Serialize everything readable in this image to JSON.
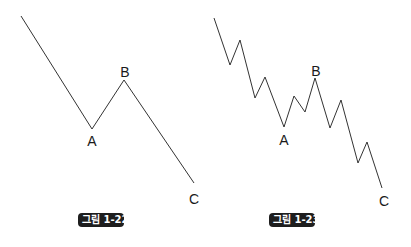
{
  "figures": [
    {
      "caption": "그림 1-22",
      "labels": {
        "A": "A",
        "B": "B",
        "C": "C"
      },
      "points": [
        [
          21,
          16
        ],
        [
          92,
          129
        ],
        [
          124,
          80
        ],
        [
          194,
          183
        ]
      ]
    },
    {
      "caption": "그림 1-23",
      "labels": {
        "A": "A",
        "B": "B",
        "C": "C"
      },
      "points": [
        [
          214,
          18
        ],
        [
          230,
          65
        ],
        [
          240,
          40
        ],
        [
          255,
          98
        ],
        [
          265,
          77
        ],
        [
          284,
          127
        ],
        [
          294,
          96
        ],
        [
          305,
          112
        ],
        [
          315,
          78
        ],
        [
          330,
          128
        ],
        [
          341,
          100
        ],
        [
          358,
          163
        ],
        [
          367,
          142
        ],
        [
          382,
          188
        ]
      ]
    }
  ],
  "colors": {
    "line": "#333333",
    "caption_bg": "#1e1e1e",
    "caption_text": "#ffffff"
  }
}
